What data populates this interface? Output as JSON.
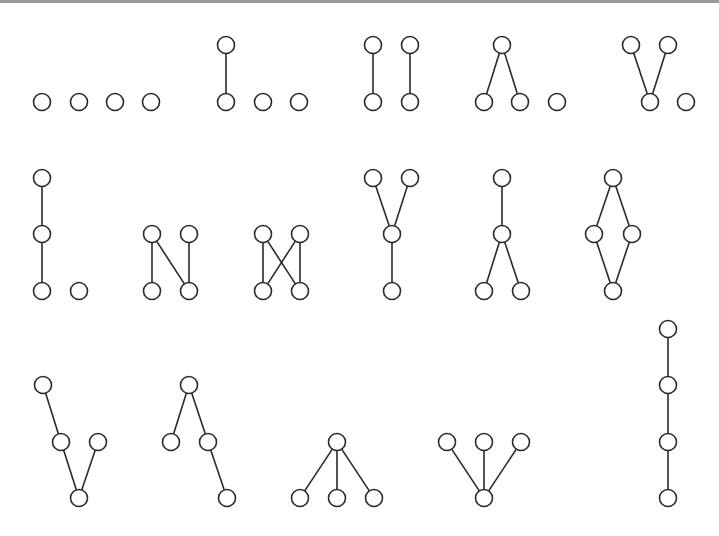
{
  "colors": {
    "stroke": "#2a2a2a",
    "node_fill": "#ffffff",
    "border": "#9a9a9a"
  },
  "posets": [
    {
      "name": "antichain-4",
      "nodes": [
        [
          42,
          102
        ],
        [
          79,
          102
        ],
        [
          115,
          102
        ],
        [
          151,
          102
        ]
      ],
      "edges": []
    },
    {
      "name": "chain2-plus-2",
      "nodes": [
        [
          226,
          45
        ],
        [
          226,
          102
        ],
        [
          263,
          102
        ],
        [
          299,
          102
        ]
      ],
      "edges": [
        [
          0,
          1
        ]
      ]
    },
    {
      "name": "two-chains-2",
      "nodes": [
        [
          373,
          45
        ],
        [
          373,
          102
        ],
        [
          410,
          45
        ],
        [
          410,
          102
        ]
      ],
      "edges": [
        [
          0,
          1
        ],
        [
          2,
          3
        ]
      ]
    },
    {
      "name": "lambda-plus-1",
      "nodes": [
        [
          502,
          45
        ],
        [
          484,
          102
        ],
        [
          520,
          102
        ],
        [
          557,
          102
        ]
      ],
      "edges": [
        [
          0,
          1
        ],
        [
          0,
          2
        ]
      ]
    },
    {
      "name": "vee-plus-1",
      "nodes": [
        [
          631,
          45
        ],
        [
          668,
          45
        ],
        [
          650,
          102
        ],
        [
          686,
          102
        ]
      ],
      "edges": [
        [
          0,
          2
        ],
        [
          1,
          2
        ]
      ]
    },
    {
      "name": "chain3-plus-1",
      "nodes": [
        [
          42,
          178
        ],
        [
          42,
          234
        ],
        [
          42,
          291
        ],
        [
          79,
          291
        ]
      ],
      "edges": [
        [
          0,
          1
        ],
        [
          1,
          2
        ]
      ]
    },
    {
      "name": "n-poset",
      "nodes": [
        [
          152,
          234
        ],
        [
          189,
          234
        ],
        [
          152,
          291
        ],
        [
          189,
          291
        ]
      ],
      "edges": [
        [
          0,
          2
        ],
        [
          0,
          3
        ],
        [
          1,
          3
        ]
      ]
    },
    {
      "name": "bowtie",
      "nodes": [
        [
          263,
          234
        ],
        [
          300,
          234
        ],
        [
          263,
          291
        ],
        [
          300,
          291
        ]
      ],
      "edges": [
        [
          0,
          2
        ],
        [
          0,
          3
        ],
        [
          1,
          2
        ],
        [
          1,
          3
        ]
      ]
    },
    {
      "name": "y-poset",
      "nodes": [
        [
          373,
          178
        ],
        [
          410,
          178
        ],
        [
          392,
          234
        ],
        [
          392,
          291
        ]
      ],
      "edges": [
        [
          0,
          2
        ],
        [
          1,
          2
        ],
        [
          2,
          3
        ]
      ]
    },
    {
      "name": "inverted-y",
      "nodes": [
        [
          502,
          178
        ],
        [
          502,
          234
        ],
        [
          484,
          291
        ],
        [
          521,
          291
        ]
      ],
      "edges": [
        [
          0,
          1
        ],
        [
          1,
          2
        ],
        [
          1,
          3
        ]
      ]
    },
    {
      "name": "diamond",
      "nodes": [
        [
          613,
          178
        ],
        [
          594,
          234
        ],
        [
          632,
          234
        ],
        [
          613,
          291
        ]
      ],
      "edges": [
        [
          0,
          1
        ],
        [
          0,
          2
        ],
        [
          1,
          3
        ],
        [
          2,
          3
        ]
      ]
    },
    {
      "name": "chain-with-branch-bottom",
      "nodes": [
        [
          43,
          385
        ],
        [
          61,
          442
        ],
        [
          98,
          442
        ],
        [
          79,
          498
        ]
      ],
      "edges": [
        [
          0,
          1
        ],
        [
          1,
          3
        ],
        [
          2,
          3
        ]
      ]
    },
    {
      "name": "chain-with-branch-top",
      "nodes": [
        [
          189,
          385
        ],
        [
          171,
          442
        ],
        [
          208,
          442
        ],
        [
          227,
          498
        ]
      ],
      "edges": [
        [
          0,
          1
        ],
        [
          0,
          2
        ],
        [
          2,
          3
        ]
      ]
    },
    {
      "name": "claw-down",
      "nodes": [
        [
          337,
          442
        ],
        [
          300,
          498
        ],
        [
          337,
          498
        ],
        [
          374,
          498
        ]
      ],
      "edges": [
        [
          0,
          1
        ],
        [
          0,
          2
        ],
        [
          0,
          3
        ]
      ]
    },
    {
      "name": "claw-up",
      "nodes": [
        [
          447,
          442
        ],
        [
          484,
          442
        ],
        [
          521,
          442
        ],
        [
          484,
          498
        ]
      ],
      "edges": [
        [
          0,
          3
        ],
        [
          1,
          3
        ],
        [
          2,
          3
        ]
      ]
    },
    {
      "name": "chain-4",
      "nodes": [
        [
          668,
          329
        ],
        [
          668,
          385
        ],
        [
          668,
          442
        ],
        [
          668,
          498
        ]
      ],
      "edges": [
        [
          0,
          1
        ],
        [
          1,
          2
        ],
        [
          2,
          3
        ]
      ]
    }
  ]
}
